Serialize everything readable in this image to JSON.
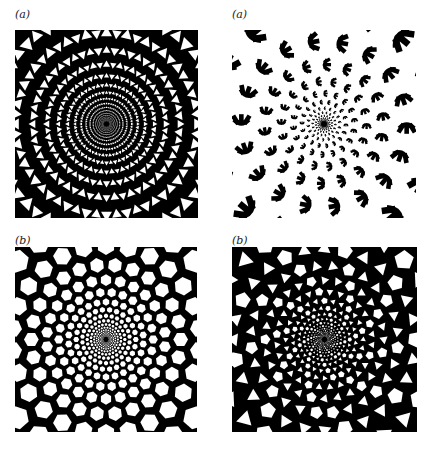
{
  "figure": {
    "panels": [
      {
        "id": "top-left",
        "label": "(a)",
        "pattern": "spiral triangular lattice (black struts, white triangular holes)",
        "x": 15,
        "y": 30,
        "w": 183,
        "h": 188,
        "kind": "triangles"
      },
      {
        "id": "top-right",
        "label": "(a)",
        "pattern": "spiral arrangement of disconnected hand-shaped (claw) black motifs",
        "x": 232,
        "y": 30,
        "w": 184,
        "h": 188,
        "kind": "claws"
      },
      {
        "id": "bottom-left",
        "label": "(b)",
        "pattern": "spiral honeycomb lattice (black network, white hexagonal holes)",
        "x": 15,
        "y": 247,
        "w": 182,
        "h": 185,
        "kind": "hexagons"
      },
      {
        "id": "bottom-right",
        "label": "(b)",
        "pattern": "spiral mixed triangle/polygon lattice (black struts, white triangles & pentagons)",
        "x": 232,
        "y": 247,
        "w": 185,
        "h": 185,
        "kind": "mixed"
      }
    ],
    "colors": {
      "ink": "#000000",
      "paper": "#ffffff"
    }
  }
}
